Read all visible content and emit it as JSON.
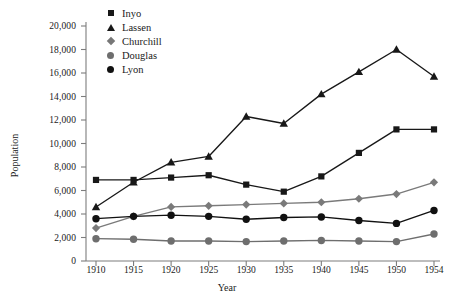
{
  "chart_data": {
    "type": "line",
    "title": "",
    "xlabel": "Year",
    "ylabel": "Population",
    "categories": [
      1910,
      1915,
      1920,
      1925,
      1930,
      1935,
      1940,
      1945,
      1950,
      1954
    ],
    "xtick_labels": [
      "1910",
      "1915",
      "1920",
      "1925",
      "1930",
      "1935",
      "1940",
      "1945",
      "1950",
      "1954"
    ],
    "ytick_labels": [
      "0",
      "2,000",
      "4,000",
      "6,000",
      "8,000",
      "10,000",
      "12,000",
      "14,000",
      "16,000",
      "18,000",
      "20,000"
    ],
    "ytick_values": [
      0,
      2000,
      4000,
      6000,
      8000,
      10000,
      12000,
      14000,
      16000,
      18000,
      20000
    ],
    "ylim": [
      0,
      20000
    ],
    "grid": false,
    "legend_position": "top-left",
    "series": [
      {
        "name": "Inyo",
        "marker": "square",
        "color": "#181818",
        "values": [
          6900,
          6900,
          7100,
          7300,
          6500,
          5900,
          7200,
          9200,
          11200,
          11200
        ]
      },
      {
        "name": "Lassen",
        "marker": "triangle",
        "color": "#181818",
        "values": [
          4600,
          6700,
          8400,
          8900,
          12300,
          11700,
          14200,
          16100,
          18000,
          15700
        ]
      },
      {
        "name": "Churchill",
        "marker": "diamond",
        "color": "#7a7a7a",
        "values": [
          2800,
          3800,
          4600,
          4700,
          4800,
          4900,
          5000,
          5300,
          5700,
          6700
        ]
      },
      {
        "name": "Douglas",
        "marker": "circle",
        "color": "#6e6e6e",
        "values": [
          1900,
          1850,
          1700,
          1700,
          1650,
          1700,
          1750,
          1700,
          1650,
          2300
        ]
      },
      {
        "name": "Lyon",
        "marker": "circle",
        "color": "#111111",
        "values": [
          3600,
          3800,
          3900,
          3800,
          3550,
          3700,
          3750,
          3450,
          3200,
          4300
        ]
      }
    ]
  },
  "legend": {
    "items": [
      {
        "label": "Inyo",
        "marker": "square"
      },
      {
        "label": "Lassen",
        "marker": "triangle"
      },
      {
        "label": "Churchill",
        "marker": "diamond"
      },
      {
        "label": "Douglas",
        "marker": "circle-gray"
      },
      {
        "label": "Lyon",
        "marker": "circle-black"
      }
    ]
  },
  "colors": {
    "axis": "#7d7d7d",
    "dark_series": "#181818",
    "gray_series": "#7a7a7a",
    "douglas": "#6e6e6e",
    "background": "#ffffff"
  }
}
